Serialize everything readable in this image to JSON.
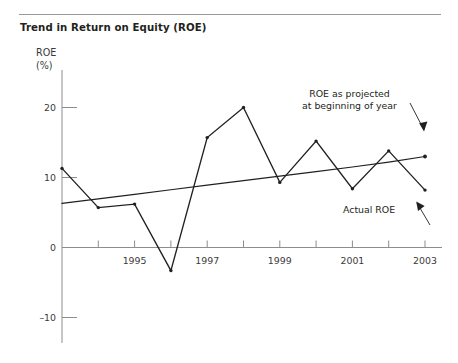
{
  "title": "Trend in Return on Equity (ROE)",
  "axis": {
    "y_label_line1": "ROE",
    "y_label_line2": "(%)"
  },
  "annotations": {
    "projected_line1": "ROE as projected",
    "projected_line2": "at beginning of year",
    "actual": "Actual  ROE"
  },
  "colors": {
    "ink": "#231f20",
    "axis": "#8d8d8d",
    "rule": "#9a9a9a",
    "series": "#231f20"
  },
  "chart_data": {
    "type": "line",
    "title": "Trend in Return on Equity (ROE)",
    "xlabel": "",
    "ylabel": "ROE (%)",
    "ylim": [
      -13,
      23
    ],
    "xlim": [
      1993,
      2003
    ],
    "grid": false,
    "legend": "none",
    "y_ticks": [
      20,
      10,
      0,
      -10
    ],
    "y_tick_labels": [
      "20",
      "10",
      "0",
      "–10"
    ],
    "x_ticks": [
      1994,
      1995,
      1996,
      1997,
      1998,
      1999,
      2000,
      2001,
      2002,
      2003
    ],
    "x_tick_labels_shown": [
      "1995",
      "1997",
      "1999",
      "2001",
      "2003"
    ],
    "x_tick_label_values": [
      1995,
      1997,
      1999,
      2001,
      2003
    ],
    "x": [
      1993,
      1994,
      1995,
      1996,
      1997,
      1998,
      1999,
      2000,
      2001,
      2002,
      2003
    ],
    "series": [
      {
        "name": "Actual ROE",
        "values": [
          11.3,
          5.7,
          6.2,
          -3.3,
          15.7,
          20.0,
          9.3,
          15.2,
          8.4,
          13.8,
          8.2
        ],
        "markers": true
      },
      {
        "name": "ROE as projected at beginning of year",
        "values": [
          6.3,
          6.95,
          7.6,
          8.25,
          8.9,
          9.55,
          10.2,
          10.85,
          11.5,
          12.2,
          13.0
        ],
        "markers": false
      }
    ],
    "annotations": [
      {
        "text": "ROE as projected at beginning of year",
        "target_x": 2003,
        "target_y": 13.0
      },
      {
        "text": "Actual  ROE",
        "target_x": 2003,
        "target_y": 8.2
      }
    ]
  }
}
